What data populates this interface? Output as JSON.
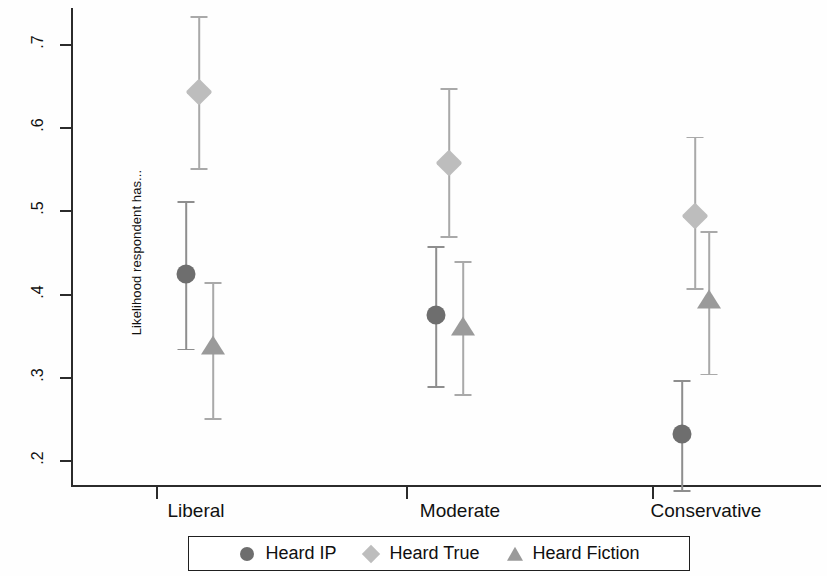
{
  "chart_data": {
    "type": "scatter",
    "title": "",
    "subtitle": "",
    "xlabel": "",
    "ylabel": "Likelihood respondent has...",
    "categories": [
      "Liberal",
      "Moderate",
      "Conservative"
    ],
    "ylim": [
      0.155,
      0.735
    ],
    "yticks": [
      0.2,
      0.3,
      0.4,
      0.5,
      0.6,
      0.7
    ],
    "ytick_labels": [
      ".2",
      ".3",
      ".4",
      ".5",
      ".6",
      ".7"
    ],
    "grid": false,
    "legend_position": "bottom-center",
    "error_bars": "95% confidence intervals",
    "series": [
      {
        "name": "Heard IP",
        "marker": "circle",
        "color": "#6e6e6e",
        "values": [
          0.425,
          0.375,
          0.232
        ],
        "ci_low": [
          0.335,
          0.29,
          0.165
        ],
        "ci_high": [
          0.512,
          0.458,
          0.297
        ]
      },
      {
        "name": "Heard True",
        "marker": "diamond",
        "color": "#bdbdbd",
        "values": [
          0.643,
          0.558,
          0.495
        ],
        "ci_low": [
          0.552,
          0.47,
          0.408
        ],
        "ci_high": [
          0.735,
          0.648,
          0.59
        ]
      },
      {
        "name": "Heard Fiction",
        "marker": "triangle",
        "color": "#9a9a9a",
        "values": [
          0.338,
          0.361,
          0.393
        ],
        "ci_low": [
          0.252,
          0.28,
          0.305
        ],
        "ci_high": [
          0.415,
          0.44,
          0.476
        ]
      }
    ]
  },
  "axis": {
    "y_title": "Likelihood respondent has...",
    "y_tick_labels": [
      ".2",
      ".3",
      ".4",
      ".5",
      ".6",
      ".7"
    ],
    "x_tick_labels": [
      "Liberal",
      "Moderate",
      "Conservative"
    ]
  },
  "legend": {
    "entries": [
      {
        "label": "Heard IP",
        "icon": "circle-marker-icon"
      },
      {
        "label": "Heard True",
        "icon": "diamond-marker-icon"
      },
      {
        "label": "Heard Fiction",
        "icon": "triangle-marker-icon"
      }
    ]
  }
}
